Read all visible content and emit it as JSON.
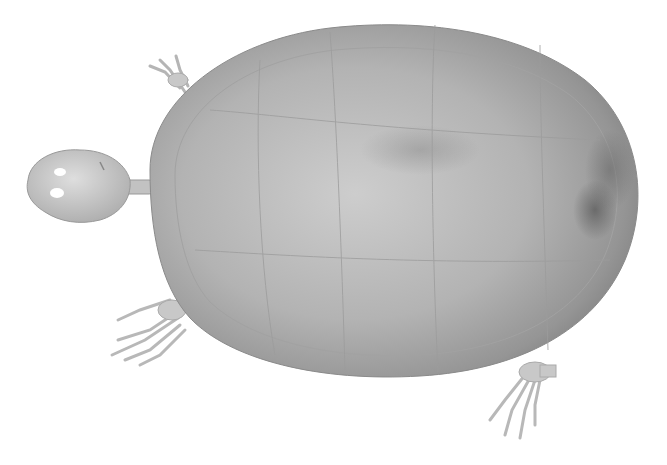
{
  "image": {
    "subject": "turtle skeleton with carapace, dorsal view",
    "background_color": "#ffffff",
    "colors": {
      "shell_light": "#c9c9c9",
      "shell_mid": "#a8a8a8",
      "shell_dark": "#6e6e6e",
      "bone": "#d4d4d4",
      "bone_shadow": "#9a9a9a"
    }
  }
}
